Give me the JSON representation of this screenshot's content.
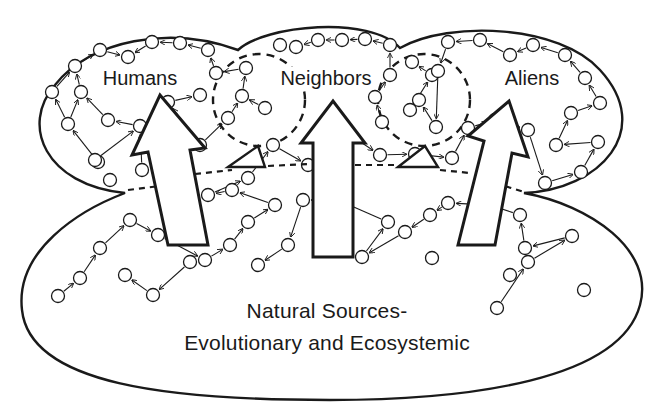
{
  "diagram": {
    "colors": {
      "ink": "#1a1a1a",
      "background": "#ffffff"
    },
    "regions": {
      "humans": {
        "label": "Humans",
        "x": 140,
        "y": 67
      },
      "neighbors": {
        "label": "Neighbors",
        "x": 326,
        "y": 67
      },
      "aliens": {
        "label": "Aliens",
        "x": 532,
        "y": 67
      }
    },
    "base": {
      "line1": "Natural Sources-",
      "line2": "Evolutionary and Ecosystemic",
      "x": 327,
      "y": 298
    },
    "big_arrows": [
      {
        "name": "humans-flow-arrow",
        "points": "168,245 208,245 190,150 205,148 160,95 132,155 148,152"
      },
      {
        "name": "neighbors-flow-arrow",
        "points": "313,257 353,257 353,143 365,143 333,101 301,143 313,143"
      },
      {
        "name": "aliens-flow-arrow",
        "points": "458,245 495,245 512,153 528,157 509,101 468,136 484,141"
      }
    ],
    "dashed_circles": [
      {
        "name": "humans-neighbors-overlap",
        "cx": 259,
        "cy": 100,
        "r": 46
      },
      {
        "name": "neighbors-aliens-overlap",
        "cx": 424,
        "cy": 100,
        "r": 46
      }
    ],
    "nodes": [
      [
        100,
        50
      ],
      [
        128,
        57
      ],
      [
        152,
        42
      ],
      [
        180,
        43
      ],
      [
        208,
        50
      ],
      [
        75,
        66
      ],
      [
        52,
        92
      ],
      [
        81,
        92
      ],
      [
        68,
        124
      ],
      [
        108,
        120
      ],
      [
        98,
        162
      ],
      [
        95,
        160
      ],
      [
        140,
        126
      ],
      [
        110,
        180
      ],
      [
        142,
        170
      ],
      [
        200,
        95
      ],
      [
        168,
        102
      ],
      [
        200,
        145
      ],
      [
        216,
        73
      ],
      [
        246,
        68
      ],
      [
        242,
        96
      ],
      [
        228,
        118
      ],
      [
        265,
        108
      ],
      [
        280,
        45
      ],
      [
        296,
        47
      ],
      [
        318,
        40
      ],
      [
        342,
        40
      ],
      [
        365,
        39
      ],
      [
        390,
        45
      ],
      [
        390,
        75
      ],
      [
        375,
        97
      ],
      [
        382,
        122
      ],
      [
        412,
        62
      ],
      [
        432,
        75
      ],
      [
        410,
        110
      ],
      [
        419,
        100
      ],
      [
        436,
        127
      ],
      [
        438,
        71
      ],
      [
        448,
        42
      ],
      [
        480,
        40
      ],
      [
        510,
        55
      ],
      [
        533,
        45
      ],
      [
        565,
        55
      ],
      [
        585,
        78
      ],
      [
        600,
        103
      ],
      [
        571,
        113
      ],
      [
        556,
        145
      ],
      [
        598,
        142
      ],
      [
        581,
        172
      ],
      [
        545,
        183
      ],
      [
        528,
        130
      ],
      [
        495,
        120
      ],
      [
        468,
        128
      ],
      [
        452,
        158
      ],
      [
        415,
        154
      ],
      [
        380,
        155
      ],
      [
        338,
        127
      ],
      [
        308,
        165
      ],
      [
        273,
        145
      ],
      [
        248,
        178
      ],
      [
        208,
        195
      ],
      [
        232,
        190
      ],
      [
        275,
        205
      ],
      [
        248,
        222
      ],
      [
        230,
        245
      ],
      [
        205,
        260
      ],
      [
        158,
        235
      ],
      [
        130,
        220
      ],
      [
        100,
        248
      ],
      [
        80,
        278
      ],
      [
        58,
        296
      ],
      [
        125,
        275
      ],
      [
        153,
        295
      ],
      [
        190,
        262
      ],
      [
        258,
        265
      ],
      [
        288,
        245
      ],
      [
        303,
        200
      ],
      [
        338,
        200
      ],
      [
        388,
        222
      ],
      [
        362,
        257
      ],
      [
        405,
        232
      ],
      [
        430,
        215
      ],
      [
        448,
        203
      ],
      [
        490,
        205
      ],
      [
        520,
        215
      ],
      [
        525,
        248
      ],
      [
        572,
        236
      ],
      [
        528,
        262
      ],
      [
        497,
        308
      ],
      [
        432,
        258
      ],
      [
        510,
        275
      ],
      [
        584,
        290
      ]
    ],
    "edges": [
      [
        0,
        1
      ],
      [
        2,
        1
      ],
      [
        3,
        2
      ],
      [
        4,
        3
      ],
      [
        5,
        0
      ],
      [
        6,
        5
      ],
      [
        7,
        5
      ],
      [
        8,
        6
      ],
      [
        8,
        7
      ],
      [
        9,
        7
      ],
      [
        10,
        8
      ],
      [
        11,
        12
      ],
      [
        12,
        9
      ],
      [
        13,
        12
      ],
      [
        14,
        12
      ],
      [
        14,
        15
      ],
      [
        16,
        15
      ],
      [
        17,
        16
      ],
      [
        17,
        21
      ],
      [
        18,
        4
      ],
      [
        19,
        18
      ],
      [
        20,
        19
      ],
      [
        21,
        20
      ],
      [
        22,
        20
      ],
      [
        22,
        24
      ],
      [
        23,
        24
      ],
      [
        25,
        24
      ],
      [
        26,
        25
      ],
      [
        27,
        26
      ],
      [
        28,
        27
      ],
      [
        29,
        28
      ],
      [
        30,
        29
      ],
      [
        31,
        30
      ],
      [
        32,
        31
      ],
      [
        33,
        32
      ],
      [
        34,
        33
      ],
      [
        35,
        34
      ],
      [
        36,
        35
      ],
      [
        37,
        36
      ],
      [
        38,
        37
      ],
      [
        39,
        38
      ],
      [
        40,
        39
      ],
      [
        41,
        40
      ],
      [
        42,
        41
      ],
      [
        43,
        42
      ],
      [
        44,
        43
      ],
      [
        45,
        44
      ],
      [
        46,
        45
      ],
      [
        47,
        46
      ],
      [
        48,
        47
      ],
      [
        49,
        48
      ],
      [
        50,
        49
      ],
      [
        51,
        50
      ],
      [
        52,
        51
      ],
      [
        53,
        52
      ],
      [
        54,
        53
      ],
      [
        55,
        54
      ],
      [
        56,
        55
      ],
      [
        57,
        56
      ],
      [
        58,
        57
      ],
      [
        59,
        58
      ],
      [
        60,
        59
      ],
      [
        61,
        60
      ],
      [
        62,
        61
      ],
      [
        63,
        62
      ],
      [
        64,
        63
      ],
      [
        65,
        64
      ],
      [
        66,
        65
      ],
      [
        67,
        66
      ],
      [
        68,
        67
      ],
      [
        69,
        68
      ],
      [
        70,
        69
      ],
      [
        71,
        70
      ],
      [
        72,
        71
      ],
      [
        73,
        72
      ],
      [
        74,
        73
      ],
      [
        75,
        74
      ],
      [
        76,
        75
      ],
      [
        77,
        76
      ],
      [
        78,
        77
      ],
      [
        79,
        78
      ],
      [
        80,
        79
      ],
      [
        81,
        80
      ],
      [
        82,
        81
      ],
      [
        83,
        82
      ],
      [
        84,
        83
      ],
      [
        85,
        84
      ],
      [
        86,
        85
      ],
      [
        87,
        86
      ],
      [
        88,
        87
      ],
      [
        89,
        88
      ],
      [
        90,
        89
      ],
      [
        91,
        90
      ]
    ]
  }
}
